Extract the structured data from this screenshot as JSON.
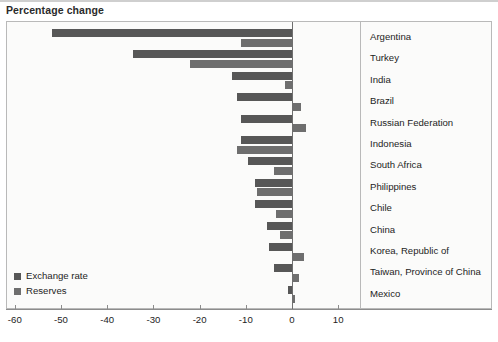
{
  "chart_title": "Percentage change",
  "legend": {
    "position": "bottom-left",
    "items": [
      {
        "label": "Exchange rate",
        "color": "#575757",
        "key": "exchange"
      },
      {
        "label": "Reserves",
        "color": "#6e6e6e",
        "key": "reserves"
      }
    ]
  },
  "axis": {
    "ticks": [
      "-60",
      "-50",
      "-40",
      "-30",
      "-20",
      "-10",
      "0",
      "10"
    ],
    "tick_values": [
      -60,
      -50,
      -40,
      -30,
      -20,
      -10,
      0,
      10
    ],
    "min": -60,
    "max": 13
  },
  "chart_data": {
    "type": "bar",
    "orientation": "horizontal",
    "title": "Percentage change",
    "xlabel": "",
    "ylabel": "",
    "xlim": [
      -60,
      13
    ],
    "grid": false,
    "legend_position": "bottom-left",
    "categories": [
      "Argentina",
      "Turkey",
      "India",
      "Brazil",
      "Russian Federation",
      "Indonesia",
      "South Africa",
      "Philippines",
      "Chile",
      "China",
      "Korea, Republic of",
      "Taiwan, Province of China",
      "Mexico"
    ],
    "series": [
      {
        "name": "Exchange rate",
        "color": "#575757",
        "values": [
          -52.0,
          -34.5,
          -13.0,
          -12.0,
          -11.0,
          -11.0,
          -9.5,
          -8.0,
          -8.0,
          -5.5,
          -5.0,
          -4.0,
          -0.8
        ]
      },
      {
        "name": "Reserves",
        "color": "#6e6e6e",
        "values": [
          -11.0,
          -22.0,
          -1.5,
          2.0,
          3.0,
          -12.0,
          -4.0,
          -7.5,
          -3.5,
          -2.5,
          2.5,
          1.5,
          0.6
        ]
      }
    ]
  }
}
